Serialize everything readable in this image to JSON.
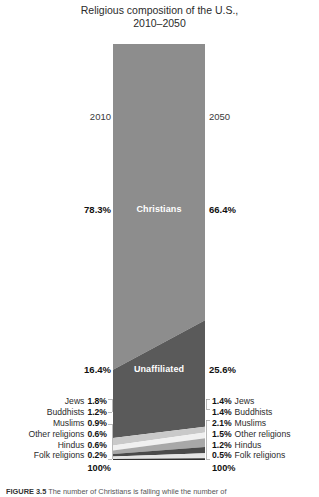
{
  "figure": {
    "title_line1": "Religious composition of the U.S.,",
    "title_line2": "2010–2050",
    "caption_prefix": "FIGURE 3.5",
    "caption_text": "The number of Christians is falling while the number of"
  },
  "axis": {
    "year_left": "2010",
    "year_right": "2050"
  },
  "bands": {
    "christians": {
      "name": "Christians",
      "left_pct": "78.3%",
      "right_pct": "66.4%"
    },
    "unaffiliated": {
      "name": "Unaffiliated",
      "left_pct": "16.4%",
      "right_pct": "25.6%"
    }
  },
  "minorities_left": [
    {
      "label": "Jews",
      "value": "1.8%"
    },
    {
      "label": "Buddhists",
      "value": "1.2%"
    },
    {
      "label": "Muslims",
      "value": "0.9%"
    },
    {
      "label": "Other religions",
      "value": "0.6%"
    },
    {
      "label": "Hindus",
      "value": "0.6%"
    },
    {
      "label": "Folk religions",
      "value": "0.2%"
    }
  ],
  "minorities_right": [
    {
      "label": "Jews",
      "value": "1.4%"
    },
    {
      "label": "Buddhists",
      "value": "1.4%"
    },
    {
      "label": "Muslims",
      "value": "2.1%"
    },
    {
      "label": "Other religions",
      "value": "1.5%"
    },
    {
      "label": "Hindus",
      "value": "1.2%"
    },
    {
      "label": "Folk religions",
      "value": "0.5%"
    }
  ],
  "totals": {
    "left": "100%",
    "right": "100%"
  },
  "colors": {
    "christians": "#8d8d8d",
    "unaffiliated": "#5a5a5a",
    "jews": "#c9c9c9",
    "buddhists": "#f0f0f0",
    "muslims": "#a8a8a8",
    "other_religions": "#4a4a4a",
    "hindus": "#e4e4e4",
    "folk_religions": "#2e2e2e",
    "background": "#ffffff",
    "text": "#1a1a1a"
  },
  "chart_data": {
    "type": "area",
    "title": "Religious composition of the U.S., 2010–2050",
    "xlabel": "",
    "ylabel": "",
    "x": [
      "2010",
      "2050"
    ],
    "ylim": [
      0,
      100
    ],
    "grid": false,
    "legend": "inline-labels",
    "stacked": true,
    "units": "percent",
    "series": [
      {
        "name": "Christians",
        "values": [
          78.3,
          66.4
        ]
      },
      {
        "name": "Unaffiliated",
        "values": [
          16.4,
          25.6
        ]
      },
      {
        "name": "Jews",
        "values": [
          1.8,
          1.4
        ]
      },
      {
        "name": "Buddhists",
        "values": [
          1.2,
          1.4
        ]
      },
      {
        "name": "Muslims",
        "values": [
          0.9,
          2.1
        ]
      },
      {
        "name": "Other religions",
        "values": [
          0.6,
          1.5
        ]
      },
      {
        "name": "Hindus",
        "values": [
          0.6,
          1.2
        ]
      },
      {
        "name": "Folk religions",
        "values": [
          0.2,
          0.5
        ]
      }
    ],
    "totals": [
      100,
      100
    ]
  }
}
